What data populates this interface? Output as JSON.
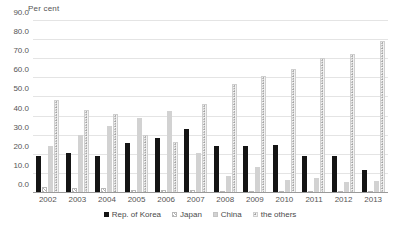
{
  "chart_data": {
    "type": "bar",
    "title": "",
    "subtitle": "",
    "xlabel": "",
    "ylabel": "Per cent",
    "ylim": [
      0,
      90
    ],
    "ytick_step": 10,
    "grid": true,
    "legend_position": "bottom",
    "categories": [
      "2002",
      "2003",
      "2004",
      "2005",
      "2006",
      "2007",
      "2008",
      "2009",
      "2010",
      "2011",
      "2012",
      "2013"
    ],
    "ytick_labels": [
      "90.0",
      "80.0",
      "70.0",
      "60.0",
      "50.0",
      "40.0",
      "30.0",
      "20.0",
      "10.0",
      "0.0"
    ],
    "ytick_values": [
      90,
      80,
      70,
      60,
      50,
      40,
      30,
      20,
      10,
      0
    ],
    "series": [
      {
        "name": "Rep. of Korea",
        "key": "korea",
        "color": "#141414",
        "pattern": "solid",
        "values": [
          19.5,
          21.0,
          19.3,
          26.3,
          28.8,
          33.6,
          24.6,
          24.6,
          24.9,
          19.6,
          19.5,
          12.2
        ]
      },
      {
        "name": "Japan",
        "key": "japan",
        "color": "#b4b4b4",
        "pattern": "diagonal-hatch",
        "values": [
          3.0,
          2.6,
          2.5,
          1.4,
          1.8,
          1.6,
          1.3,
          1.2,
          1.1,
          1.0,
          0.9,
          0.8
        ]
      },
      {
        "name": "China",
        "key": "china",
        "color": "#d2d2d2",
        "pattern": "solid",
        "values": [
          24.5,
          30.4,
          35.1,
          39.4,
          42.9,
          21.0,
          9.0,
          13.5,
          6.6,
          8.0,
          5.6,
          6.5
        ]
      },
      {
        "name": "the others",
        "key": "others",
        "color": "#f2f2f2",
        "pattern": "dotted",
        "values": [
          48.8,
          43.6,
          41.4,
          30.5,
          26.7,
          46.5,
          57.2,
          61.0,
          64.8,
          70.6,
          72.8,
          79.7
        ]
      }
    ]
  },
  "legend": {
    "items": [
      {
        "label": "Rep. of Korea",
        "key": "korea"
      },
      {
        "label": "Japan",
        "key": "japan"
      },
      {
        "label": "China",
        "key": "china"
      },
      {
        "label": "the others",
        "key": "others"
      }
    ]
  }
}
